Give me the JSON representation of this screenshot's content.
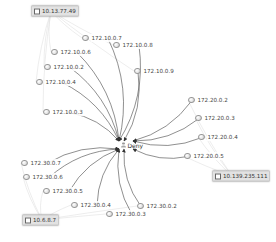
{
  "diagram": {
    "type": "network-graph",
    "center": {
      "label": "Deny",
      "icon": "person-icon",
      "x": 121,
      "y": 145
    },
    "hosts": [
      {
        "id": "h1",
        "label": "10.13.77.49",
        "x": 31,
        "y": 11
      },
      {
        "id": "h2",
        "label": "10.139.235.111",
        "x": 212,
        "y": 176
      },
      {
        "id": "h3",
        "label": "10.6.8.7",
        "x": 22,
        "y": 220
      }
    ],
    "nodes": [
      {
        "label": "172.10.0.7",
        "x": 82,
        "y": 38,
        "group": "172.10",
        "host": "h1"
      },
      {
        "label": "172.10.0.8",
        "x": 113,
        "y": 45,
        "group": "172.10",
        "host": "h1"
      },
      {
        "label": "172.10.0.6",
        "x": 51,
        "y": 52,
        "group": "172.10",
        "host": "h1"
      },
      {
        "label": "172.10.0.2",
        "x": 44,
        "y": 67,
        "group": "172.10",
        "host": "h1"
      },
      {
        "label": "172.10.0.4",
        "x": 36,
        "y": 82,
        "group": "172.10",
        "host": "h1"
      },
      {
        "label": "172.10.0.9",
        "x": 134,
        "y": 71,
        "group": "172.10",
        "host": "h1"
      },
      {
        "label": "172.10.0.3",
        "x": 43,
        "y": 112,
        "group": "172.10",
        "host": "h1"
      },
      {
        "label": "172.20.0.2",
        "x": 188,
        "y": 100,
        "group": "172.20",
        "host": "h2"
      },
      {
        "label": "172.20.0.3",
        "x": 195,
        "y": 118,
        "group": "172.20",
        "host": "h2"
      },
      {
        "label": "172.20.0.4",
        "x": 198,
        "y": 137,
        "group": "172.20",
        "host": "h2"
      },
      {
        "label": "172.20.0.5",
        "x": 184,
        "y": 156,
        "group": "172.20",
        "host": "h2"
      },
      {
        "label": "172.30.0.7",
        "x": 21,
        "y": 163,
        "group": "172.30",
        "host": "h3"
      },
      {
        "label": "172.30.0.6",
        "x": 23,
        "y": 177,
        "group": "172.30",
        "host": "h3"
      },
      {
        "label": "172.30.0.5",
        "x": 43,
        "y": 191,
        "group": "172.30",
        "host": "h3"
      },
      {
        "label": "172.30.0.4",
        "x": 71,
        "y": 205,
        "group": "172.30",
        "host": "h3"
      },
      {
        "label": "172.30.0.3",
        "x": 106,
        "y": 214,
        "group": "172.30",
        "host": "h3"
      },
      {
        "label": "172.30.0.2",
        "x": 137,
        "y": 206,
        "group": "172.30",
        "host": "h3"
      }
    ],
    "colors": {
      "edge": "#333333",
      "host_edge": "#e0e0e0",
      "host_box": "#e2e2e2"
    }
  }
}
